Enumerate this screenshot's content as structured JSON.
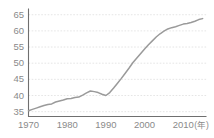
{
  "chart_data": {
    "type": "line",
    "title": "",
    "subtitle": "",
    "xlabel": "(年)",
    "ylabel": "",
    "xlim": [
      1970,
      2016
    ],
    "ylim": [
      33.5,
      66
    ],
    "grid": true,
    "legend": false,
    "legend_position": "none",
    "series_color": "#9a9a9a",
    "grid_color": "#dedede",
    "axis_color": "#6f6f6f",
    "text_color": "#8a8a8a",
    "background_color": "#ffffff",
    "yticks": [
      35,
      40,
      45,
      50,
      55,
      60,
      65
    ],
    "ytick_labels": [
      "35",
      "40",
      "45",
      "50",
      "55",
      "60",
      "65"
    ],
    "xticks": [
      1970,
      1980,
      1990,
      2000,
      2010
    ],
    "xtick_labels": [
      "1970",
      "1980",
      "1990",
      "2000",
      "2010"
    ],
    "unit_label": "(年)",
    "series": [
      {
        "name": "series-1",
        "color": "#9a9a9a",
        "x": [
          1970,
          1971,
          1972,
          1973,
          1974,
          1975,
          1976,
          1977,
          1978,
          1979,
          1980,
          1981,
          1982,
          1983,
          1984,
          1985,
          1986,
          1987,
          1988,
          1989,
          1990,
          1991,
          1992,
          1993,
          1994,
          1995,
          1996,
          1997,
          1998,
          1999,
          2000,
          2001,
          2002,
          2003,
          2004,
          2005,
          2006,
          2007,
          2008,
          2009,
          2010,
          2011,
          2012,
          2013,
          2014,
          2015
        ],
        "values": [
          35.3,
          35.7,
          36.1,
          36.5,
          36.9,
          37.2,
          37.4,
          38.0,
          38.3,
          38.6,
          39.0,
          39.1,
          39.4,
          39.5,
          40.1,
          40.8,
          41.4,
          41.2,
          40.9,
          40.4,
          40.0,
          40.9,
          42.3,
          43.8,
          45.3,
          46.9,
          48.5,
          50.2,
          51.6,
          53.0,
          54.4,
          55.7,
          56.9,
          58.1,
          59.1,
          59.9,
          60.6,
          61.0,
          61.3,
          61.7,
          62.1,
          62.3,
          62.6,
          63.0,
          63.5,
          63.8
        ]
      }
    ]
  },
  "axes": {
    "y_axis_name": "y-axis",
    "x_axis_name": "x-axis"
  }
}
